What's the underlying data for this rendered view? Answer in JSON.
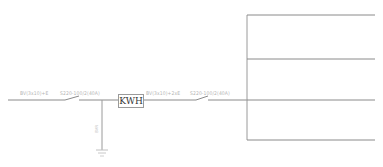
{
  "diagram": {
    "header_text": "· ·········· ·· ··· ·· ······ ····· ···",
    "incoming_cable_label": "BV(3x10)+E",
    "main_breaker_label": "S220-100/2(40A)",
    "meter_label": "KWH",
    "meter_cable_label": "BV(3x10)+2xE",
    "outgoing_breaker_label": "S220-100/2(40A)",
    "ground_label": "BVR",
    "colors": {
      "line": "#8a8a8a",
      "text": "#b5b5b5",
      "meter_text": "#333333"
    }
  }
}
